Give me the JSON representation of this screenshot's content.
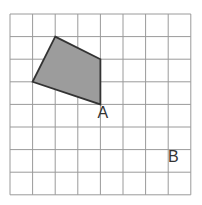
{
  "grid": {
    "cols": 8,
    "rows": 8,
    "left": 10,
    "top": 14,
    "cell": 22.6,
    "line_color": "#9a9a9a"
  },
  "shape": {
    "vertices": [
      [
        2,
        1
      ],
      [
        4,
        2
      ],
      [
        4,
        4
      ],
      [
        1,
        3
      ]
    ],
    "fill": "#9c9c9c",
    "stroke": "#333333"
  },
  "labels": [
    {
      "text": "A",
      "col": 4,
      "row": 4,
      "dx": 5,
      "dy": 14
    },
    {
      "text": "B",
      "col": 7.2,
      "row": 6.3,
      "dx": 0,
      "dy": 0
    }
  ]
}
